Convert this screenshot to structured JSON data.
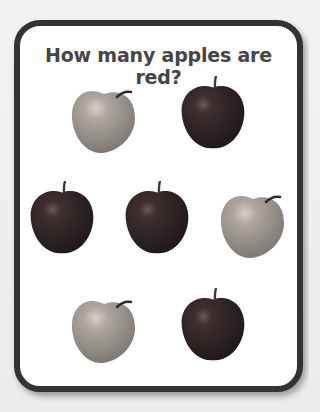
{
  "worksheet": {
    "title": "How many apples are red?",
    "colors": {
      "border": "#333333",
      "title_text": "#454545",
      "red_apple": "#3a2a2c",
      "pale_apple": "#a6a09a"
    },
    "apples": [
      {
        "row": 1,
        "position": 1,
        "type": "pale"
      },
      {
        "row": 1,
        "position": 2,
        "type": "red"
      },
      {
        "row": 2,
        "position": 1,
        "type": "red"
      },
      {
        "row": 2,
        "position": 2,
        "type": "red"
      },
      {
        "row": 2,
        "position": 3,
        "type": "pale"
      },
      {
        "row": 3,
        "position": 1,
        "type": "pale"
      },
      {
        "row": 3,
        "position": 2,
        "type": "red"
      }
    ],
    "apple_count": {
      "total": 7,
      "red": 4,
      "not_red": 3
    }
  }
}
